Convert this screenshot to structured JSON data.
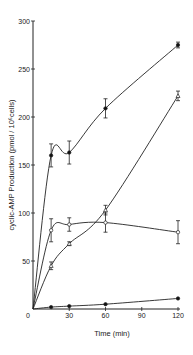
{
  "chart_data": {
    "type": "line",
    "title": "",
    "xlabel": "Time (min)",
    "ylabel": "cyclic-AMP Production (pmol / 10^6 cells)",
    "xlim": [
      0,
      120
    ],
    "ylim": [
      0,
      300
    ],
    "xticks": [
      0,
      30,
      60,
      90,
      120
    ],
    "yticks": [
      50,
      100,
      150,
      200,
      250,
      300
    ],
    "grid": false,
    "legend": "none",
    "series": [
      {
        "name": "filled circles (high)",
        "marker": "filled-circle",
        "x": [
          0,
          15,
          30,
          60,
          120
        ],
        "values": [
          0,
          160,
          163,
          209,
          275
        ],
        "errors": [
          0,
          12,
          12,
          10,
          3
        ]
      },
      {
        "name": "open triangles (linear)",
        "marker": "open-triangle",
        "x": [
          0,
          15,
          30,
          60,
          120
        ],
        "values": [
          0,
          45,
          68,
          103,
          222
        ],
        "errors": [
          0,
          4,
          2,
          5,
          5
        ]
      },
      {
        "name": "open circles (plateau)",
        "marker": "open-circle",
        "x": [
          0,
          15,
          30,
          60,
          120
        ],
        "values": [
          0,
          82,
          88,
          90,
          80
        ],
        "errors": [
          0,
          12,
          7,
          10,
          12
        ]
      },
      {
        "name": "filled circles (basal)",
        "marker": "filled-circle",
        "x": [
          0,
          15,
          30,
          60,
          120
        ],
        "values": [
          0,
          2,
          3,
          5,
          11
        ],
        "errors": [
          0,
          0,
          0,
          0,
          0
        ]
      }
    ]
  },
  "axes": {
    "x_title": "Time (min)",
    "y_title": "cyclic-AMP Production (pmol / 10⁶cells)",
    "x_origin_label": "0"
  }
}
